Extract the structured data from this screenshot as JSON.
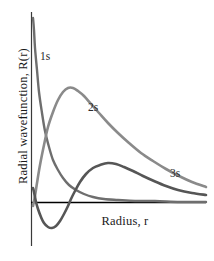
{
  "figure": {
    "background_color": "#ffffff",
    "width": 214,
    "height": 261
  },
  "axes": {
    "x_label": "Radius, r",
    "y_label": "Radial wavefunction, R(r)",
    "x_axis_color": "#000000",
    "y_axis_color": "#3a3a3a",
    "zero_line_y_px": 202,
    "y_axis_x_px": 31
  },
  "curve_labels": {
    "one_s": "1s",
    "two_s": "2s",
    "three_s": "3s"
  },
  "chart_data": {
    "type": "line",
    "title": "",
    "subtitle": "",
    "xlabel": "Radius, r",
    "ylabel": "Radial wavefunction, R(r)",
    "xlim": [
      0,
      1
    ],
    "ylim": [
      -0.18,
      1.0
    ],
    "grid": false,
    "legend_position": "inline-annotations",
    "annotations": [
      {
        "text": "1s",
        "x_px": 42,
        "y_px": 57
      },
      {
        "text": "2s",
        "x_px": 90,
        "y_px": 109
      },
      {
        "text": "3s",
        "x_px": 172,
        "y_px": 175
      }
    ],
    "series": [
      {
        "name": "1s",
        "color": "#6e6e6e",
        "line_width": 2.4,
        "description": "Monotonic exponential decay from a large positive value at r=0, never crossing zero.",
        "points_px": [
          [
            33,
            18
          ],
          [
            34,
            30
          ],
          [
            35,
            48
          ],
          [
            37,
            70
          ],
          [
            39,
            92
          ],
          [
            42,
            113
          ],
          [
            45,
            131
          ],
          [
            49,
            147
          ],
          [
            53,
            160
          ],
          [
            58,
            170
          ],
          [
            63,
            178
          ],
          [
            69,
            185
          ],
          [
            76,
            190
          ],
          [
            84,
            194
          ],
          [
            93,
            197
          ],
          [
            104,
            199
          ],
          [
            118,
            200
          ],
          [
            135,
            201
          ],
          [
            155,
            201
          ],
          [
            180,
            202
          ],
          [
            206,
            202
          ]
        ]
      },
      {
        "name": "2s",
        "color": "#8a8a8a",
        "line_width": 2.6,
        "description": "Starts near zero at r=0 after a small negative region, rises to a broad maximum then decays slowly; has one radial node.",
        "points_px": [
          [
            33,
            206
          ],
          [
            35,
            196
          ],
          [
            37,
            183
          ],
          [
            40,
            165
          ],
          [
            44,
            145
          ],
          [
            48,
            127
          ],
          [
            53,
            112
          ],
          [
            58,
            100
          ],
          [
            63,
            92
          ],
          [
            68,
            88
          ],
          [
            73,
            88
          ],
          [
            78,
            91
          ],
          [
            84,
            96
          ],
          [
            91,
            104
          ],
          [
            99,
            113
          ],
          [
            108,
            123
          ],
          [
            118,
            133
          ],
          [
            129,
            143
          ],
          [
            141,
            153
          ],
          [
            153,
            161
          ],
          [
            166,
            169
          ],
          [
            179,
            176
          ],
          [
            192,
            182
          ],
          [
            206,
            187
          ]
        ]
      },
      {
        "name": "3s",
        "color": "#565656",
        "line_width": 2.6,
        "description": "Small positive lobe at small r, dips to a negative minimum, crosses zero, rises to a low broad maximum, then decays; has two radial nodes.",
        "points_px": [
          [
            33,
            188
          ],
          [
            34,
            192
          ],
          [
            35,
            197
          ],
          [
            36,
            202
          ],
          [
            38,
            209
          ],
          [
            41,
            217
          ],
          [
            44,
            223
          ],
          [
            48,
            227
          ],
          [
            52,
            228
          ],
          [
            56,
            226
          ],
          [
            60,
            221
          ],
          [
            64,
            214
          ],
          [
            68,
            206
          ],
          [
            71,
            199
          ],
          [
            75,
            191
          ],
          [
            80,
            182
          ],
          [
            86,
            174
          ],
          [
            93,
            168
          ],
          [
            100,
            165
          ],
          [
            108,
            163
          ],
          [
            116,
            164
          ],
          [
            124,
            167
          ],
          [
            133,
            171
          ],
          [
            143,
            176
          ],
          [
            154,
            181
          ],
          [
            166,
            186
          ],
          [
            178,
            190
          ],
          [
            192,
            193
          ],
          [
            206,
            195
          ]
        ]
      }
    ]
  }
}
